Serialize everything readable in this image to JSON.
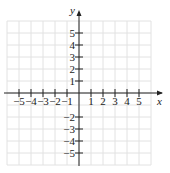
{
  "chart_data": {
    "type": "line",
    "title": "",
    "xlabel": "x",
    "ylabel": "y",
    "xlim": [
      -6,
      6
    ],
    "ylim": [
      -6,
      6
    ],
    "grid": true,
    "x_ticks": [
      "-5",
      "-4",
      "-3",
      "-2",
      "-1",
      "1",
      "2",
      "3",
      "4",
      "5"
    ],
    "y_ticks": [
      "5",
      "4",
      "3",
      "2",
      "1",
      "-2",
      "-3",
      "-4",
      "-5"
    ],
    "series": []
  },
  "colors": {
    "grid": "#e2e2e2",
    "axis": "#222222",
    "text": "#222222"
  }
}
